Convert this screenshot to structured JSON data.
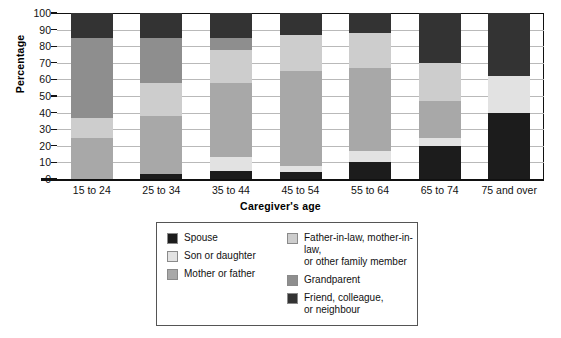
{
  "chart_data": {
    "type": "bar",
    "subtype": "stacked-bar-100",
    "title": "",
    "xlabel": "Caregiver's age",
    "ylabel": "Percentage",
    "ylim": [
      0,
      100
    ],
    "ytick_labels": [
      "0",
      "10",
      "20",
      "30",
      "40",
      "50",
      "60",
      "70",
      "80",
      "90",
      "100"
    ],
    "ytick_values": [
      0,
      10,
      20,
      30,
      40,
      50,
      60,
      70,
      80,
      90,
      100
    ],
    "grid": true,
    "grid_axis": "y",
    "legend_position": "below-center",
    "categories": [
      "15 to 24",
      "25 to 34",
      "35 to 44",
      "45 to 54",
      "55 to 64",
      "65 to 74",
      "75 and over"
    ],
    "series": [
      {
        "name": "Spouse",
        "color": "#1c1c1c",
        "values": [
          0,
          3,
          5,
          4,
          10,
          20,
          40
        ]
      },
      {
        "name": "Son or daughter",
        "color": "#e2e2e2",
        "values": [
          0,
          0,
          8,
          4,
          7,
          5,
          22
        ]
      },
      {
        "name": "Mother or father",
        "color": "#a8a8a8",
        "values": [
          25,
          35,
          45,
          57,
          50,
          22,
          0
        ]
      },
      {
        "name": "Father-in-law, mother-in-law,\nor other family member",
        "color": "#cdcdcd",
        "values": [
          12,
          20,
          20,
          22,
          21,
          23,
          0
        ]
      },
      {
        "name": "Grandparent",
        "color": "#8e8e8e",
        "values": [
          48,
          27,
          7,
          0,
          0,
          0,
          0
        ]
      },
      {
        "name": "Friend, colleague,\nor neighbour",
        "color": "#333333",
        "values": [
          15,
          15,
          15,
          13,
          12,
          30,
          38
        ]
      }
    ]
  },
  "legend": {
    "items_left": [
      {
        "label": "Spouse",
        "color": "#1c1c1c"
      },
      {
        "label": "Son or daughter",
        "color": "#e2e2e2"
      },
      {
        "label": "Mother or father",
        "color": "#a8a8a8"
      }
    ],
    "items_right": [
      {
        "label": "Father-in-law, mother-in-law,\nor other family member",
        "color": "#cdcdcd"
      },
      {
        "label": "Grandparent",
        "color": "#8e8e8e"
      },
      {
        "label": "Friend, colleague,\nor neighbour",
        "color": "#333333"
      }
    ]
  }
}
